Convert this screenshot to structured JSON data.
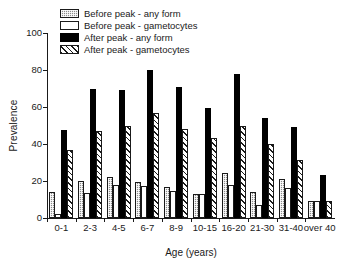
{
  "chart_data": {
    "type": "bar",
    "title": "",
    "xlabel": "Age (years)",
    "ylabel": "Prevalence",
    "categories": [
      "0-1",
      "2-3",
      "4-5",
      "6-7",
      "8-9",
      "10-15",
      "16-20",
      "21-30",
      "31-40",
      "over 40"
    ],
    "ylim": [
      0,
      100
    ],
    "yticks": [
      0,
      20,
      40,
      60,
      80,
      100
    ],
    "grid": false,
    "legend_position": "top-left",
    "series": [
      {
        "name": "Before peak - any form",
        "fill": "checkered-gray",
        "color": "#8c8c8c",
        "values": [
          14,
          20,
          22,
          19.5,
          17,
          13,
          24.5,
          14,
          21,
          9
        ]
      },
      {
        "name": "Before peak - gametocytes",
        "fill": "white-outline",
        "color": "#ffffff",
        "values": [
          2,
          13.5,
          18,
          17.5,
          14.5,
          13,
          18,
          7,
          16,
          9
        ]
      },
      {
        "name": "After peak - any form",
        "fill": "solid-black",
        "color": "#000000",
        "values": [
          47.5,
          70,
          69,
          80,
          71,
          59.5,
          78,
          54,
          49,
          23
        ]
      },
      {
        "name": "After peak - gametocytes",
        "fill": "diagonal-hatch",
        "color": "#ffffff",
        "values": [
          37,
          47,
          49.5,
          57,
          48,
          43,
          49.5,
          40,
          31.5,
          9
        ]
      }
    ]
  }
}
